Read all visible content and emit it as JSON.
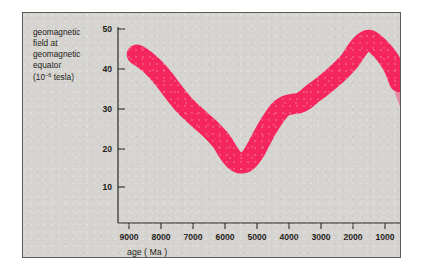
{
  "figure": {
    "panel_color": "#d6d4d0",
    "border_color": "#5d5b58",
    "curve_color": "#f5255e"
  },
  "ylabel": {
    "line1": "geomagnetic",
    "line2": "field at",
    "line3": "geomagnetic",
    "line4": "equator",
    "units_prefix": "(10",
    "units_exponent": "−6",
    "units_suffix": " tesla)"
  },
  "xlabel": "age ( Ma )",
  "chart_data": {
    "type": "line",
    "title": "",
    "subtitle": "",
    "xlabel": "age ( Ma )",
    "ylabel": "geomagnetic field at geomagnetic equator (10−6 tesla)",
    "xlim": [
      9400,
      400
    ],
    "ylim": [
      0,
      53
    ],
    "x_inverted": true,
    "grid": false,
    "legend": null,
    "xticks": [
      9000,
      8000,
      7000,
      6000,
      5000,
      4000,
      3000,
      2000,
      1000
    ],
    "xticklabels": [
      "9000",
      "8000",
      "7000",
      "6000",
      "5000",
      "4000",
      "3000",
      "2000",
      "1000"
    ],
    "yticks": [
      10,
      20,
      30,
      40,
      50
    ],
    "yticklabels": [
      "10",
      "20",
      "30",
      "40",
      "50"
    ],
    "series": [
      {
        "name": "geomagnetic field at geomagnetic equator",
        "style": "thick uncertainty band",
        "color": "#f5255e",
        "band_halfwidth": 2.6,
        "x": [
          8750,
          8500,
          8200,
          7900,
          7600,
          7300,
          7000,
          6700,
          6400,
          6100,
          5900,
          5700,
          5500,
          5300,
          5100,
          4900,
          4700,
          4500,
          4300,
          4100,
          3900,
          3700,
          3500,
          3300,
          3000,
          2700,
          2400,
          2100,
          1900,
          1700,
          1500,
          1300,
          1100,
          900,
          700,
          550
        ],
        "y": [
          43.5,
          42.2,
          40.0,
          37.2,
          34.0,
          31.0,
          28.6,
          26.4,
          24.2,
          21.5,
          18.8,
          16.8,
          16.0,
          16.6,
          18.6,
          21.6,
          24.6,
          27.2,
          29.4,
          30.6,
          31.0,
          31.2,
          32.0,
          33.4,
          35.2,
          37.2,
          39.4,
          42.0,
          44.4,
          46.4,
          47.2,
          46.2,
          44.6,
          42.6,
          39.8,
          36.6
        ]
      }
    ],
    "annotations": [
      {
        "text": "curve is drawn as a broad band indicating uncertainty",
        "kind": "style_note"
      },
      {
        "text": "band is clipped by the right frame edge",
        "kind": "clip_note"
      }
    ]
  }
}
